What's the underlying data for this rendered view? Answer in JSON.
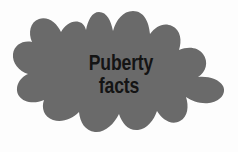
{
  "graphic": {
    "type": "blob-splat-shape",
    "name": "gray-splat-blob",
    "fill_color": "#6a6a6a",
    "background_color": "#fdfdfd"
  },
  "label": {
    "line1": "Puberty",
    "line2": "facts",
    "full_text": "Puberty facts",
    "text_color": "#141414"
  }
}
